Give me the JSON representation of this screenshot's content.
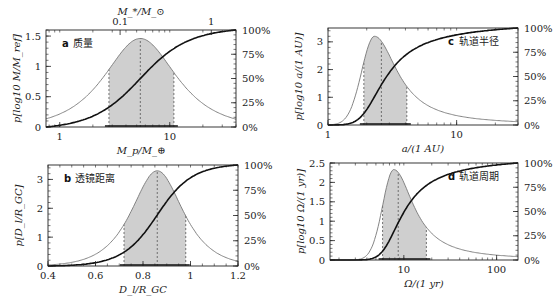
{
  "chart_data": [
    {
      "id": "a",
      "type": "area",
      "panel_letter": "a",
      "panel_title": "质量",
      "xscale": "log",
      "xlim": [
        0.75,
        40
      ],
      "xticks": [
        1,
        10
      ],
      "xtick_labels": [
        "1",
        "10"
      ],
      "xlabel": "M_p/M_⊕",
      "top_xlabel": "M_*/M_⊙",
      "top_xticks_labels": [
        "0.1",
        "1"
      ],
      "ylabel": "p[log10 M/M_ref]",
      "ylim": [
        0,
        1.6
      ],
      "yticks": [
        0,
        0.5,
        1,
        1.5
      ],
      "ytick_labels": [
        "0",
        "0.5",
        "1",
        "1.5"
      ],
      "right_ytick_labels": [
        "0%",
        "25%",
        "50%",
        "75%",
        "100%"
      ],
      "peak_x": 5.4,
      "peak_y": 1.46,
      "width_log": 0.36,
      "shade_range": [
        2.8,
        10.9
      ],
      "median": 5.4,
      "label_pos": "left"
    },
    {
      "id": "c",
      "type": "area",
      "panel_letter": "c",
      "panel_title": "轨道半径",
      "xscale": "log",
      "xlim": [
        1,
        30
      ],
      "xticks": [
        1,
        10
      ],
      "xtick_labels": [
        "1",
        "10"
      ],
      "xlabel": "a/(1 AU)",
      "ylabel": "p[log10 a/(1 AU)]",
      "ylim": [
        0,
        3.5
      ],
      "yticks": [
        0,
        1,
        2,
        3
      ],
      "ytick_labels": [
        "0",
        "1",
        "2",
        "3"
      ],
      "right_ytick_labels": [
        "0%",
        "25%",
        "50%",
        "75%",
        "100%"
      ],
      "peak_x": 2.3,
      "peak_y": 3.2,
      "width_log": 0.1,
      "shade_range": [
        1.9,
        4.1
      ],
      "median": 2.6,
      "label_pos": "right"
    },
    {
      "id": "b",
      "type": "area",
      "panel_letter": "b",
      "panel_title": "透镜距离",
      "xscale": "linear",
      "xlim": [
        0.4,
        1.2
      ],
      "xticks": [
        0.4,
        0.6,
        0.8,
        1,
        1.2
      ],
      "xtick_labels": [
        "0.4",
        "0.6",
        "0.8",
        "1",
        "1.2"
      ],
      "xlabel": "D_l/R_GC",
      "ylabel": "p[D_l/R_GC]",
      "ylim": [
        0,
        3.5
      ],
      "yticks": [
        0,
        1,
        2,
        3
      ],
      "ytick_labels": [
        "0",
        "1",
        "2",
        "3"
      ],
      "right_ytick_labels": [
        "0%",
        "25%",
        "50%",
        "75%",
        "100%"
      ],
      "peak_x": 0.86,
      "peak_y": 3.3,
      "width_lin": 0.12,
      "shade_range": [
        0.72,
        0.98
      ],
      "median": 0.86,
      "label_pos": "left"
    },
    {
      "id": "d",
      "type": "area",
      "panel_letter": "d",
      "panel_title": "轨道周期",
      "xscale": "log",
      "xlim": [
        1.6,
        170
      ],
      "xticks": [
        10,
        100
      ],
      "xtick_labels": [
        "10",
        "100"
      ],
      "xlabel": "Ω/(1 yr)",
      "ylabel": "p[log10 Ω/(1 yr)]",
      "ylim": [
        0,
        2.5
      ],
      "yticks": [
        0,
        0.5,
        1,
        1.5,
        2,
        2.5
      ],
      "ytick_labels": [
        "0",
        "0.5",
        "1",
        "1.5",
        "2",
        "2.5"
      ],
      "right_ytick_labels": [
        "0%",
        "25%",
        "50%",
        "75%",
        "100%"
      ],
      "peak_x": 7.8,
      "peak_y": 2.33,
      "width_log": 0.12,
      "shade_range": [
        5.9,
        17.5
      ],
      "median": 8.7,
      "label_pos": "right"
    }
  ]
}
